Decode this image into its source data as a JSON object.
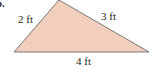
{
  "problem_label": "b.",
  "triangle": {
    "fill": "#f2cfbd",
    "stroke": "#6b6b6b",
    "sides": {
      "left": "2 ft",
      "right": "3 ft",
      "bottom": "4 ft"
    }
  }
}
